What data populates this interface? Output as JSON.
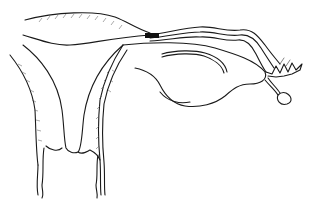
{
  "figure": {
    "type": "line-drawing",
    "colors": {
      "stroke": "#1a1a1a",
      "background": "#ffffff",
      "band": "#111111"
    },
    "parts": [
      {
        "id": "peritoneal-fold",
        "label": ""
      },
      {
        "id": "uterine-wall-left",
        "label": ""
      },
      {
        "id": "uterine-cavity",
        "label": ""
      },
      {
        "id": "fallopian-tube",
        "label": ""
      },
      {
        "id": "fimbriae",
        "label": ""
      },
      {
        "id": "ovary",
        "label": ""
      },
      {
        "id": "ovarian-ligament",
        "label": ""
      },
      {
        "id": "small-cyst",
        "label": ""
      },
      {
        "id": "cervical-canal",
        "label": ""
      }
    ]
  }
}
